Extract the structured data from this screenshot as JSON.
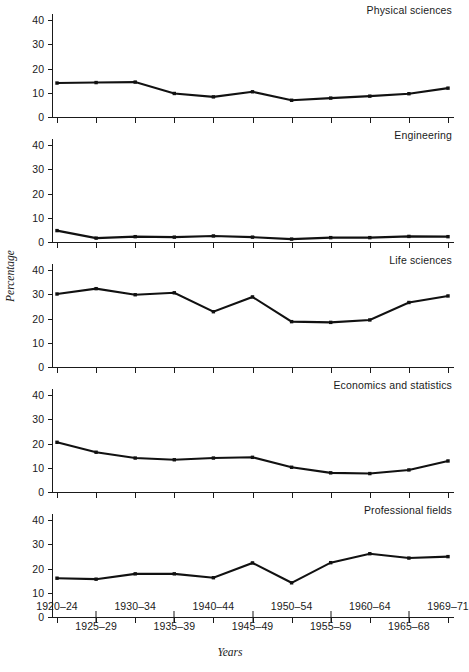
{
  "chart_data": {
    "type": "line",
    "title": "",
    "xlabel": "Years",
    "ylabel": "Percentage",
    "ylim": [
      0,
      44
    ],
    "yticks": [
      0,
      10,
      20,
      30,
      40
    ],
    "ytick_labels": [
      "0",
      "10",
      "20",
      "30",
      "40"
    ],
    "grid": false,
    "legend_position": "panel-title-top-right",
    "categories": [
      "1920-24",
      "1925-29",
      "1930-34",
      "1935-39",
      "1940-44",
      "1945-49",
      "1950-54",
      "1955-59",
      "1960-64",
      "1965-68",
      "1969-71"
    ],
    "xtick_labels_upper": [
      "1920–24",
      "1930–34",
      "1940–44",
      "1950–54",
      "1960–64",
      "1969–71"
    ],
    "xtick_labels_lower": [
      "1925–29",
      "1935–39",
      "1945–49",
      "1955–59",
      "1965–68"
    ],
    "panels": [
      {
        "name": "Physical sciences",
        "values": [
          14.0,
          14.2,
          14.4,
          9.7,
          8.3,
          10.4,
          6.9,
          7.8,
          8.6,
          9.6,
          11.9
        ]
      },
      {
        "name": "Engineering",
        "values": [
          4.7,
          1.6,
          2.2,
          2.0,
          2.5,
          2.0,
          1.2,
          1.8,
          1.8,
          2.3,
          2.2
        ]
      },
      {
        "name": "Life sciences",
        "values": [
          30.1,
          32.3,
          29.8,
          30.6,
          22.8,
          28.9,
          18.7,
          18.4,
          19.4,
          26.6,
          29.3
        ]
      },
      {
        "name": "Economics and statistics",
        "values": [
          20.5,
          16.4,
          14.0,
          13.3,
          14.0,
          14.3,
          10.2,
          7.9,
          7.6,
          9.1,
          12.8
        ]
      },
      {
        "name": "Professional fields",
        "values": [
          16.0,
          15.6,
          17.8,
          17.8,
          16.2,
          22.3,
          14.1,
          22.4,
          26.1,
          24.3,
          24.9
        ]
      }
    ],
    "colors": {
      "line": "#111111",
      "axis": "#1a1a1a",
      "background": "#ffffff"
    }
  }
}
